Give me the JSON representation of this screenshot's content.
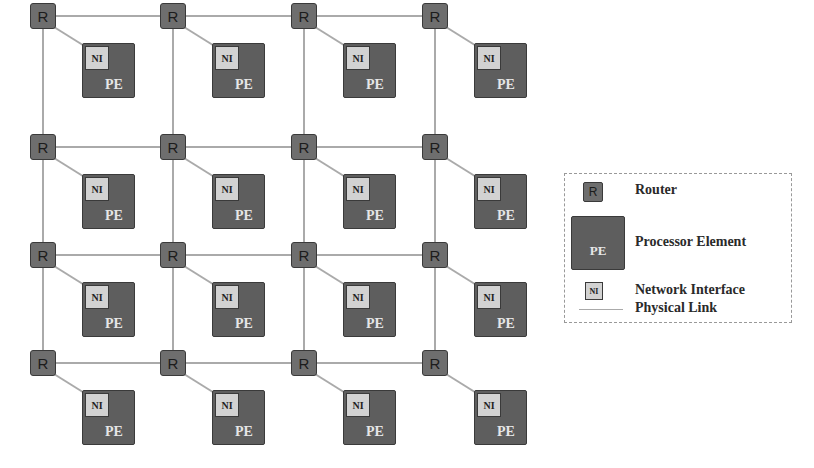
{
  "diagram": {
    "type": "2D mesh network-on-chip",
    "rows": 4,
    "cols": 4,
    "node_labels": {
      "router": "R",
      "network_interface": "NI",
      "processor_element": "PE"
    },
    "colors": {
      "router_fill": "#6e6e6e",
      "pe_fill": "#5e5e5e",
      "ni_fill": "#d2d2d2",
      "link": "#aaaaaa",
      "border": "#3a3a3a"
    }
  },
  "legend": {
    "items": [
      {
        "icon": "router-icon",
        "symbol": "R",
        "label": "Router"
      },
      {
        "icon": "processor-element-icon",
        "symbol": "PE",
        "label": "Processor Element"
      },
      {
        "icon": "network-interface-icon",
        "symbol": "NI",
        "label": "Network Interface"
      },
      {
        "icon": "physical-link-icon",
        "symbol": "",
        "label": "Physical Link"
      }
    ]
  }
}
